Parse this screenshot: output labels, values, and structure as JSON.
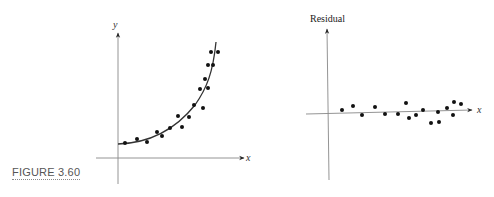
{
  "figure": {
    "caption": "FIGURE 3.60"
  },
  "chart_data": [
    {
      "type": "scatter",
      "title": "",
      "xlabel": "x",
      "ylabel": "y",
      "grid": false,
      "legend": "none",
      "annotations": [
        "fitted exponential curve"
      ],
      "points": [
        [
          125,
          143
        ],
        [
          137,
          139
        ],
        [
          147,
          142
        ],
        [
          157,
          132
        ],
        [
          162,
          136
        ],
        [
          170,
          128
        ],
        [
          178,
          116
        ],
        [
          182,
          127
        ],
        [
          189,
          117
        ],
        [
          194,
          105
        ],
        [
          200,
          89
        ],
        [
          203,
          108
        ],
        [
          205,
          79
        ],
        [
          208,
          65
        ],
        [
          208,
          88
        ],
        [
          211,
          52
        ],
        [
          213,
          65
        ],
        [
          218,
          52
        ]
      ],
      "curve_description": "smooth increasing exponential-like curve from (118,144) to (216,42)"
    },
    {
      "type": "scatter",
      "title": "",
      "xlabel": "x",
      "ylabel": "Residual",
      "grid": false,
      "legend": "none",
      "annotations": [
        "residuals scattered randomly around zero line"
      ],
      "points": [
        [
          342,
          110
        ],
        [
          353,
          106
        ],
        [
          362,
          115
        ],
        [
          375,
          107
        ],
        [
          385,
          114
        ],
        [
          398,
          114
        ],
        [
          406,
          103
        ],
        [
          409,
          118
        ],
        [
          416,
          115
        ],
        [
          423,
          110
        ],
        [
          431,
          123
        ],
        [
          438,
          112
        ],
        [
          439,
          122
        ],
        [
          447,
          108
        ],
        [
          453,
          115
        ],
        [
          454,
          102
        ],
        [
          461,
          104
        ]
      ]
    }
  ]
}
